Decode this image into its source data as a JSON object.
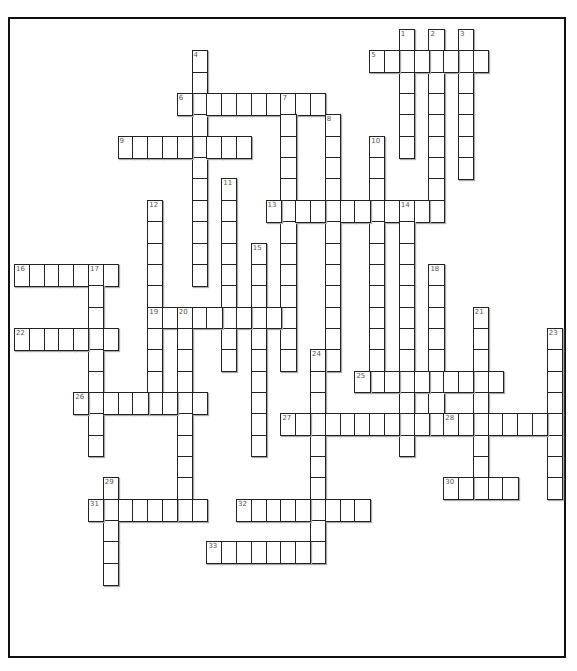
{
  "puzzle": {
    "type": "crossword",
    "cell_w": 14.8,
    "cell_h": 21.35,
    "origin_x": 14,
    "origin_y": 29,
    "words": [
      {
        "num": 1,
        "dir": "down",
        "col": 26,
        "row": 0,
        "len": 6
      },
      {
        "num": 2,
        "dir": "down",
        "col": 28,
        "row": 0,
        "len": 9
      },
      {
        "num": 3,
        "dir": "down",
        "col": 30,
        "row": 0,
        "len": 7
      },
      {
        "num": 4,
        "dir": "down",
        "col": 12,
        "row": 1,
        "len": 11
      },
      {
        "num": 5,
        "dir": "across",
        "col": 24,
        "row": 1,
        "len": 8
      },
      {
        "num": 6,
        "dir": "across",
        "col": 11,
        "row": 3,
        "len": 10
      },
      {
        "num": 7,
        "dir": "down",
        "col": 18,
        "row": 3,
        "len": 13
      },
      {
        "num": 8,
        "dir": "down",
        "col": 21,
        "row": 4,
        "len": 12
      },
      {
        "num": 9,
        "dir": "across",
        "col": 7,
        "row": 5,
        "len": 9
      },
      {
        "num": 10,
        "dir": "down",
        "col": 24,
        "row": 5,
        "len": 12
      },
      {
        "num": 11,
        "dir": "down",
        "col": 14,
        "row": 7,
        "len": 9
      },
      {
        "num": 12,
        "dir": "down",
        "col": 9,
        "row": 8,
        "len": 10
      },
      {
        "num": 13,
        "dir": "across",
        "col": 17,
        "row": 8,
        "len": 12
      },
      {
        "num": 14,
        "dir": "down",
        "col": 26,
        "row": 8,
        "len": 12
      },
      {
        "num": 15,
        "dir": "down",
        "col": 16,
        "row": 10,
        "len": 10
      },
      {
        "num": 16,
        "dir": "across",
        "col": 0,
        "row": 11,
        "len": 7
      },
      {
        "num": 17,
        "dir": "down",
        "col": 5,
        "row": 11,
        "len": 9
      },
      {
        "num": 18,
        "dir": "down",
        "col": 28,
        "row": 11,
        "len": 8
      },
      {
        "num": 19,
        "dir": "across",
        "col": 9,
        "row": 13,
        "len": 10
      },
      {
        "num": 20,
        "dir": "down",
        "col": 11,
        "row": 13,
        "len": 10
      },
      {
        "num": 21,
        "dir": "down",
        "col": 31,
        "row": 13,
        "len": 9
      },
      {
        "num": 22,
        "dir": "across",
        "col": 0,
        "row": 14,
        "len": 7
      },
      {
        "num": 23,
        "dir": "down",
        "col": 36,
        "row": 14,
        "len": 8
      },
      {
        "num": 24,
        "dir": "down",
        "col": 20,
        "row": 15,
        "len": 10
      },
      {
        "num": 25,
        "dir": "across",
        "col": 23,
        "row": 16,
        "len": 10
      },
      {
        "num": 26,
        "dir": "across",
        "col": 4,
        "row": 17,
        "len": 9
      },
      {
        "num": 27,
        "dir": "across",
        "col": 18,
        "row": 18,
        "len": 10
      },
      {
        "num": 28,
        "dir": "across",
        "col": 29,
        "row": 18,
        "len": 8
      },
      {
        "num": 29,
        "dir": "down",
        "col": 6,
        "row": 21,
        "len": 5
      },
      {
        "num": 30,
        "dir": "across",
        "col": 29,
        "row": 21,
        "len": 5
      },
      {
        "num": 31,
        "dir": "across",
        "col": 5,
        "row": 22,
        "len": 8
      },
      {
        "num": 32,
        "dir": "across",
        "col": 15,
        "row": 22,
        "len": 9
      },
      {
        "num": 33,
        "dir": "across",
        "col": 13,
        "row": 24,
        "len": 8
      }
    ]
  }
}
